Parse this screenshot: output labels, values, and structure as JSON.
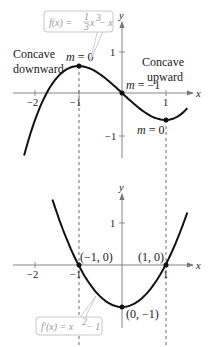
{
  "chart_data": [
    {
      "type": "line",
      "title": "",
      "function_label": "f(x) = (1/3)x^3 − x",
      "function_label_parts": {
        "lhs": "f(x) = ",
        "num": "1",
        "den": "3",
        "rest": "x",
        "exp": "3",
        "tail": " − x"
      },
      "xlabel": "x",
      "ylabel": "y",
      "xlim": [
        -2.25,
        1.5
      ],
      "ylim": [
        -1.5,
        1.7
      ],
      "x_ticks": [
        -2,
        -1,
        1
      ],
      "x_tick_labels": [
        "−2",
        "−1",
        "1"
      ],
      "y_ticks": [
        1,
        -1
      ],
      "y_tick_labels": [
        "1",
        "−1"
      ],
      "grid": false,
      "series": [
        {
          "name": "f(x) = (1/3)x^3 − x",
          "x": [
            -2.25,
            -2,
            -1.5,
            -1,
            -0.5,
            0,
            0.5,
            1,
            1.5
          ],
          "y": [
            -1.547,
            -0.667,
            0.375,
            0.667,
            0.458,
            0,
            -0.458,
            -0.667,
            -0.375
          ]
        }
      ],
      "points": [
        {
          "x": -1,
          "y": 0.667,
          "label": "m = 0"
        },
        {
          "x": 0,
          "y": 0,
          "label": "m = −1"
        },
        {
          "x": 1,
          "y": -0.667,
          "label": "m = 0"
        }
      ],
      "annotations": [
        {
          "text": "Concave",
          "text2": "downward"
        },
        {
          "text": "Concave",
          "text2": "upward"
        }
      ]
    },
    {
      "type": "line",
      "title": "",
      "function_label": "f′(x) = x^2 − 1",
      "function_label_parts": {
        "lhs": "f′(x) = x",
        "exp": "2",
        "tail": " − 1"
      },
      "xlabel": "x",
      "ylabel": "y",
      "xlim": [
        -1.6,
        1.5
      ],
      "ylim": [
        -1.3,
        1.8
      ],
      "x_ticks": [
        -2,
        -1,
        1
      ],
      "x_tick_labels": [
        "−2",
        "−1",
        "1"
      ],
      "y_ticks": [
        1
      ],
      "y_tick_labels": [
        "1"
      ],
      "grid": false,
      "series": [
        {
          "name": "f′(x) = x^2 − 1",
          "x": [
            -1.6,
            -1,
            -0.5,
            0,
            0.5,
            1,
            1.5
          ],
          "y": [
            1.56,
            0,
            -0.75,
            -1,
            -0.75,
            0,
            1.25
          ]
        }
      ],
      "points": [
        {
          "x": -1,
          "y": 0,
          "label": "(−1, 0)"
        },
        {
          "x": 1,
          "y": 0,
          "label": "(1, 0)"
        },
        {
          "x": 0,
          "y": -1,
          "label": "(0, −1)"
        }
      ]
    }
  ],
  "top": {
    "box": {
      "lhs": "f(x) = ",
      "num": "1",
      "den": "3",
      "x": "x",
      "exp": "3",
      "tail": " − x"
    },
    "concave_down": [
      "Concave",
      "downward"
    ],
    "concave_up": [
      "Concave",
      "upward"
    ],
    "m_max": "m = 0",
    "m_origin": "m = −1",
    "m_min": "m = 0",
    "xaxis": "x",
    "yaxis": "y",
    "ticks": {
      "xm2": "−2",
      "xm1": "−1",
      "x1": "1",
      "y1": "1",
      "ym1": "−1"
    }
  },
  "bottom": {
    "box": {
      "lhs": "f′(x) = x",
      "exp": "2",
      "tail": " − 1"
    },
    "pt_left": "(−1, 0)",
    "pt_right": "(1, 0)",
    "pt_vertex": "(0, −1)",
    "xaxis": "x",
    "yaxis": "y",
    "ticks": {
      "xm2": "−2",
      "xm1": "−1",
      "x1": "1",
      "y1": "1"
    }
  },
  "colors": {
    "curve": "#111111",
    "axis": "#555555",
    "box_border": "#c8c8c8",
    "box_text": "#9a9a9a",
    "dash": "#444444"
  }
}
